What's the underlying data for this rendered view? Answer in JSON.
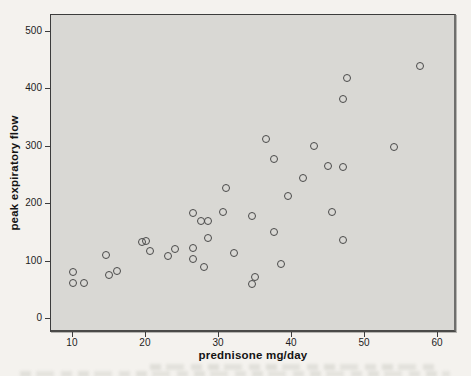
{
  "chart_data": {
    "type": "scatter",
    "title": "",
    "xlabel": "prednisone mg/day",
    "ylabel": "peak expiratory flow",
    "xlim": [
      7,
      62.6
    ],
    "ylim": [
      -24.5,
      529.5
    ],
    "x_ticks": [
      10,
      20,
      30,
      40,
      50,
      60
    ],
    "y_ticks": [
      0,
      100,
      200,
      300,
      400,
      500
    ],
    "grid": false,
    "legend": null,
    "marker": "open-circle",
    "points": [
      [
        57.5,
        440
      ],
      [
        47.5,
        419
      ],
      [
        47,
        384
      ],
      [
        36.5,
        314
      ],
      [
        43,
        301
      ],
      [
        54,
        300
      ],
      [
        37.5,
        279
      ],
      [
        45,
        267
      ],
      [
        47,
        265
      ],
      [
        41.5,
        246
      ],
      [
        31,
        228
      ],
      [
        39.5,
        214
      ],
      [
        30.5,
        186
      ],
      [
        26.5,
        184
      ],
      [
        45.5,
        186
      ],
      [
        34.5,
        179
      ],
      [
        27.5,
        171
      ],
      [
        28.5,
        170
      ],
      [
        37.5,
        152
      ],
      [
        28.5,
        141
      ],
      [
        47,
        138
      ],
      [
        19.5,
        134
      ],
      [
        20,
        136
      ],
      [
        20.5,
        118
      ],
      [
        26.5,
        124
      ],
      [
        24,
        122
      ],
      [
        23,
        110
      ],
      [
        26.5,
        104
      ],
      [
        32,
        115
      ],
      [
        14.5,
        112
      ],
      [
        38.5,
        96
      ],
      [
        28,
        91
      ],
      [
        16,
        84
      ],
      [
        10,
        82
      ],
      [
        15,
        76
      ],
      [
        35,
        73
      ],
      [
        11.5,
        63
      ],
      [
        10,
        62
      ],
      [
        34.5,
        61
      ]
    ]
  },
  "colors": {
    "page_bg": "#f4f2ee",
    "plot_bg": "#d9d8d4",
    "frame": "#3c3c3c",
    "marker_stroke": "#4a4a4a",
    "text": "#1d1d1d"
  }
}
